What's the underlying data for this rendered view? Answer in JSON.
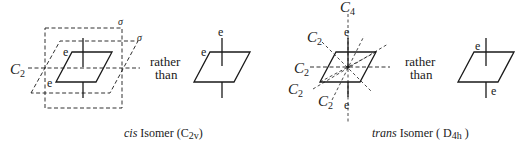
{
  "figure": {
    "colors": {
      "ink": "#1a1a1a",
      "background": "#ffffff"
    },
    "cis": {
      "caption": {
        "italic": "cis",
        "text": " Isomer (",
        "group": "C",
        "group_sub": "2v",
        "close": ")"
      },
      "axis_label": {
        "main": "C",
        "sub": "2"
      },
      "sigma_1": "σ",
      "sigma_2": "σ",
      "ligand_1": "e",
      "ligand_2": "e",
      "comparison": {
        "line1": "rather",
        "line2": "than"
      },
      "alt_ligand_1": "e",
      "alt_ligand_2": "e"
    },
    "trans": {
      "caption": {
        "italic": "trans",
        "text": " Isomer ( ",
        "group": "D",
        "group_sub": "4h",
        "close": " )"
      },
      "c4_label": {
        "main": "C",
        "sub": "4"
      },
      "c2_labels": [
        {
          "main": "C",
          "sub": "2"
        },
        {
          "main": "C",
          "sub": "2"
        },
        {
          "main": "C",
          "sub": "2"
        },
        {
          "main": "C",
          "sub": "2"
        }
      ],
      "ligand_top": "e",
      "ligand_bottom": "e",
      "comparison": {
        "line1": "rather",
        "line2": "than"
      },
      "alt_ligand_1": "e",
      "alt_ligand_2": "e"
    }
  }
}
